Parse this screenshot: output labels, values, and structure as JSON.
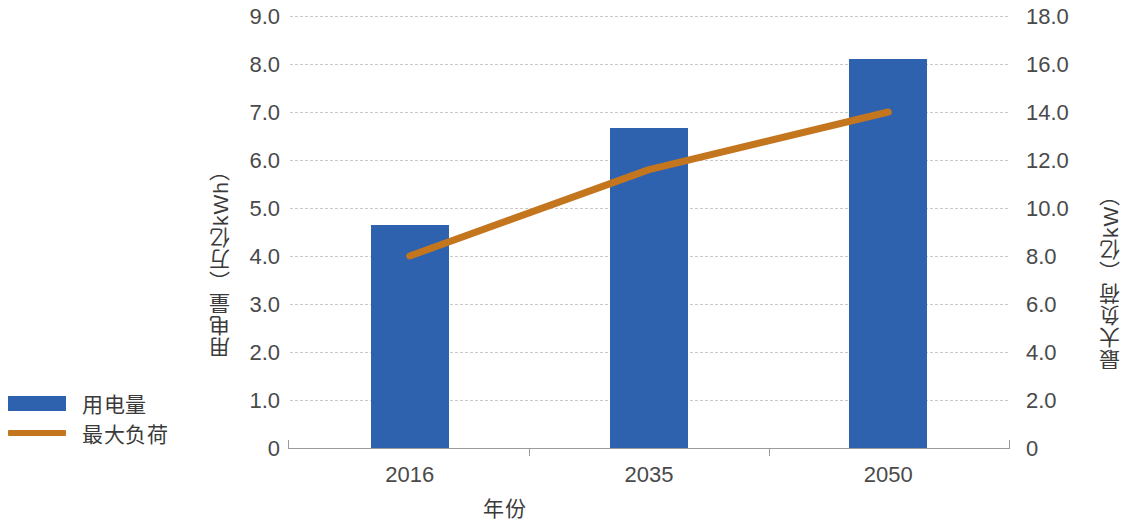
{
  "chart_data": {
    "type": "bar",
    "title": "",
    "xlabel": "年份",
    "categories": [
      "2016",
      "2035",
      "2050"
    ],
    "series": [
      {
        "name": "用电量",
        "type": "bar",
        "axis": "left",
        "unit": "万亿kWh",
        "color": "#2E62AE",
        "values": [
          4.65,
          6.67,
          8.1
        ]
      },
      {
        "name": "最大负荷",
        "type": "line",
        "axis": "right",
        "unit": "亿kW",
        "color": "#C4761F",
        "values": [
          8.0,
          11.6,
          14.0
        ]
      }
    ],
    "y_left": {
      "label": "用电量（万亿kWh）",
      "ticks": [
        "0",
        "1.0",
        "2.0",
        "3.0",
        "4.0",
        "5.0",
        "6.0",
        "7.0",
        "8.0",
        "9.0"
      ],
      "min": 0,
      "max": 9,
      "step": 1
    },
    "y_right": {
      "label": "最大负荷（亿kW）",
      "ticks": [
        "0",
        "2.0",
        "4.0",
        "6.0",
        "8.0",
        "10.0",
        "12.0",
        "14.0",
        "16.0",
        "18.0"
      ],
      "min": 0,
      "max": 18,
      "step": 2
    },
    "grid": true,
    "legend_position": "left-bottom"
  },
  "legend": {
    "items": [
      {
        "label": "用电量",
        "marker": "bar-swatch"
      },
      {
        "label": "最大负荷",
        "marker": "line-swatch"
      }
    ]
  },
  "axes": {
    "x_title": "年份",
    "y_left_title": "用电量（万亿kWh）",
    "y_right_title": "最大负荷（亿kW）",
    "x_categories": [
      "2016",
      "2035",
      "2050"
    ],
    "y_left_ticks": [
      "9.0",
      "8.0",
      "7.0",
      "6.0",
      "5.0",
      "4.0",
      "3.0",
      "2.0",
      "1.0",
      "0"
    ],
    "y_right_ticks": [
      "18.0",
      "16.0",
      "14.0",
      "12.0",
      "10.0",
      "8.0",
      "6.0",
      "4.0",
      "2.0",
      "0"
    ]
  },
  "colors": {
    "bar": "#2E62AE",
    "line": "#C4761F",
    "grid": "#c9c9c9",
    "axis": "#9a9a9a",
    "text": "#404040"
  }
}
